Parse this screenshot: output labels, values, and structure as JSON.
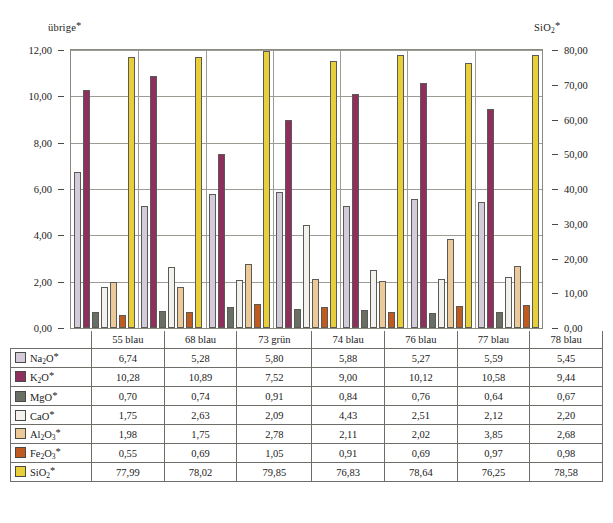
{
  "chart_data": {
    "type": "bar",
    "title": "",
    "categories": [
      "55 blau",
      "68 blau",
      "73 grün",
      "74 blau",
      "76 blau",
      "77 blau",
      "78 blau"
    ],
    "series": [
      {
        "name": "Na2O*",
        "label": "Na₂O*",
        "color": "#d3cbd9",
        "axis": "left",
        "values": [
          6.74,
          5.28,
          5.8,
          5.88,
          5.27,
          5.59,
          5.45
        ]
      },
      {
        "name": "K2O*",
        "label": "K₂O*",
        "color": "#8e2f5e",
        "axis": "left",
        "values": [
          10.28,
          10.89,
          7.52,
          9.0,
          10.12,
          10.58,
          9.44
        ]
      },
      {
        "name": "MgO*",
        "label": "MgO*",
        "color": "#6a6f66",
        "axis": "left",
        "values": [
          0.7,
          0.74,
          0.91,
          0.84,
          0.76,
          0.64,
          0.67
        ]
      },
      {
        "name": "CaO*",
        "label": "CaO*",
        "color": "#f2f1ed",
        "axis": "left",
        "values": [
          1.75,
          2.63,
          2.09,
          4.43,
          2.51,
          2.12,
          2.2
        ]
      },
      {
        "name": "Al2O3*",
        "label": "Al₂O₃*",
        "color": "#ecc999",
        "axis": "left",
        "values": [
          1.98,
          1.75,
          2.78,
          2.11,
          2.02,
          3.85,
          2.68
        ]
      },
      {
        "name": "Fe2O3*",
        "label": "Fe₂O₃*",
        "color": "#c15a1e",
        "axis": "left",
        "values": [
          0.55,
          0.69,
          1.05,
          0.91,
          0.69,
          0.97,
          0.98
        ]
      },
      {
        "name": "SiO2*",
        "label": "SiO₂*",
        "color": "#e8cf3a",
        "axis": "right",
        "values": [
          77.99,
          78.02,
          79.85,
          76.83,
          78.64,
          76.25,
          78.58
        ]
      }
    ],
    "left_axis": {
      "title": "übrige*",
      "min": 0,
      "max": 12,
      "step": 2,
      "ticks": [
        "0,00",
        "2,00",
        "4,00",
        "6,00",
        "8,00",
        "10,00",
        "12,00"
      ]
    },
    "right_axis": {
      "title": "SiO2*",
      "min": 0,
      "max": 80,
      "step": 10,
      "ticks": [
        "0,00",
        "10,00",
        "20,00",
        "30,00",
        "40,00",
        "50,00",
        "60,00",
        "70,00",
        "80,00"
      ]
    },
    "grid": true,
    "legend": "table-below",
    "decimal_separator": ","
  },
  "axes": {
    "left_title_main": "übrige",
    "left_title_star": "*",
    "right_title_main": "SiO",
    "right_title_sub": "2",
    "right_title_star": "*"
  },
  "table": {
    "column_headers": [
      "",
      "55 blau",
      "68 blau",
      "73 grün",
      "74 blau",
      "76 blau",
      "77 blau",
      "78 blau"
    ],
    "rows": [
      {
        "swatch": "#d3cbd9",
        "main": "Na",
        "sub": "2",
        "tail": "O",
        "star": "*",
        "values": [
          "6,74",
          "5,28",
          "5,80",
          "5,88",
          "5,27",
          "5,59",
          "5,45"
        ]
      },
      {
        "swatch": "#8e2f5e",
        "main": "K",
        "sub": "2",
        "tail": "O",
        "star": "*",
        "values": [
          "10,28",
          "10,89",
          "7,52",
          "9,00",
          "10,12",
          "10,58",
          "9,44"
        ]
      },
      {
        "swatch": "#6a6f66",
        "main": "MgO",
        "sub": "",
        "tail": "",
        "star": "*",
        "values": [
          "0,70",
          "0,74",
          "0,91",
          "0,84",
          "0,76",
          "0,64",
          "0,67"
        ]
      },
      {
        "swatch": "#f2f1ed",
        "main": "CaO",
        "sub": "",
        "tail": "",
        "star": "*",
        "values": [
          "1,75",
          "2,63",
          "2,09",
          "4,43",
          "2,51",
          "2,12",
          "2,20"
        ]
      },
      {
        "swatch": "#ecc999",
        "main": "Al",
        "sub": "2",
        "tail": "O",
        "tailsub": "3",
        "star": "*",
        "values": [
          "1,98",
          "1,75",
          "2,78",
          "2,11",
          "2,02",
          "3,85",
          "2,68"
        ]
      },
      {
        "swatch": "#c15a1e",
        "main": "Fe",
        "sub": "2",
        "tail": "O",
        "tailsub": "3",
        "star": "*",
        "values": [
          "0,55",
          "0,69",
          "1,05",
          "0,91",
          "0,69",
          "0,97",
          "0,98"
        ]
      },
      {
        "swatch": "#e8cf3a",
        "main": "SiO",
        "sub": "2",
        "tail": "",
        "star": "*",
        "values": [
          "77,99",
          "78,02",
          "79,85",
          "76,83",
          "78,64",
          "76,25",
          "78,58"
        ]
      }
    ]
  }
}
